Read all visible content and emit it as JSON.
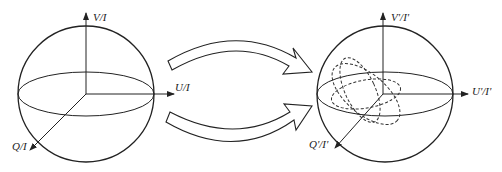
{
  "diagram": {
    "left_sphere": {
      "axes": {
        "v": "V/I",
        "u": "U/I",
        "q": "Q/I"
      }
    },
    "right_sphere": {
      "axes": {
        "v": "V'/I'",
        "u": "U'/I'",
        "q": "Q'/I'"
      }
    },
    "arrows": [
      "transform-arrow-top",
      "transform-arrow-bottom"
    ],
    "colors": {
      "stroke": "#222222",
      "background": "#ffffff"
    }
  }
}
